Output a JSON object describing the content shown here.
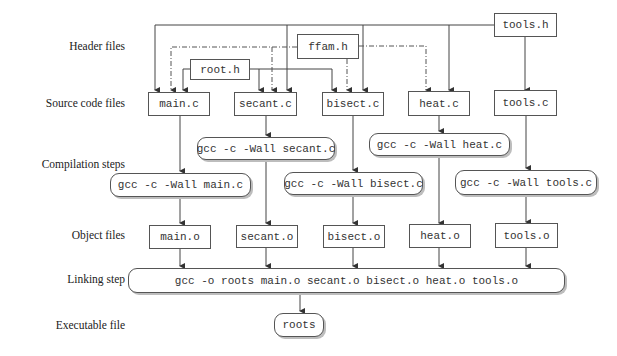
{
  "row_labels": {
    "header": "Header files",
    "source": "Source code files",
    "compile": "Compilation steps",
    "object": "Object files",
    "link": "Linking step",
    "exec": "Executable file"
  },
  "headers": {
    "tools_h": "tools.h",
    "ffam_h": "ffam.h",
    "root_h": "root.h"
  },
  "sources": {
    "main_c": "main.c",
    "secant_c": "secant.c",
    "bisect_c": "bisect.c",
    "heat_c": "heat.c",
    "tools_c": "tools.c"
  },
  "compile": {
    "main": "gcc -c -Wall main.c",
    "secant": "gcc -c -Wall secant.c",
    "bisect": "gcc -c -Wall bisect.c",
    "heat": "gcc -c -Wall heat.c",
    "tools": "gcc -c -Wall tools.c"
  },
  "objects": {
    "main_o": "main.o",
    "secant_o": "secant.o",
    "bisect_o": "bisect.o",
    "heat_o": "heat.o",
    "tools_o": "tools.o"
  },
  "link": "gcc -o roots main.o secant.o bisect.o heat.o tools.o",
  "executable": "roots"
}
